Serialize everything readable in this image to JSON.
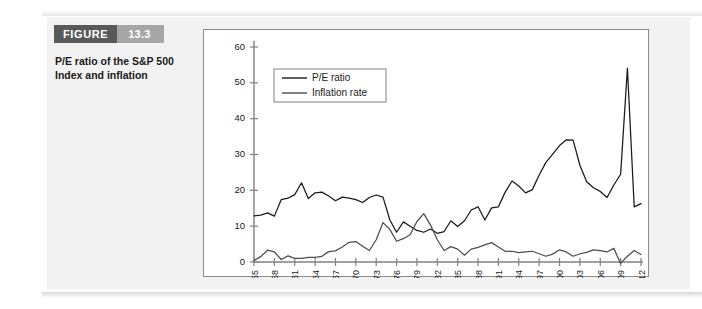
{
  "figure": {
    "tag_label": "FIGURE",
    "number": "13.3",
    "caption_line1": "P/E ratio of the S&P 500",
    "caption_line2": "Index and inflation"
  },
  "colors": {
    "tag_bg": "#595959",
    "number_bg": "#a6a6a6",
    "page_bg": "#f2f2f2",
    "chart_bg": "#ffffff",
    "chart_border": "#8c8c8c",
    "axis": "#808080",
    "pe_line": "#1a1a1a",
    "inflation_line": "#4d4d4d"
  },
  "chart_data": {
    "type": "line",
    "title": "",
    "xlabel": "",
    "ylabel": "",
    "xlim": [
      1955,
      2012
    ],
    "ylim": [
      0,
      60
    ],
    "yticks": [
      0,
      10,
      20,
      30,
      40,
      50,
      60
    ],
    "xticks": [
      1955,
      1958,
      1961,
      1964,
      1967,
      1970,
      1973,
      1976,
      1979,
      1982,
      1985,
      1988,
      1991,
      1994,
      1997,
      2000,
      2003,
      2006,
      2009,
      2012
    ],
    "xtick_labels": [
      "1955",
      "1958",
      "1961",
      "1964",
      "1967",
      "1970",
      "1973",
      "1976",
      "1979",
      "1982",
      "1985",
      "1988",
      "1991",
      "1994",
      "1997",
      "2000",
      "2003",
      "2006",
      "2009",
      "2012"
    ],
    "grid": false,
    "legend_position": "upper-left-inside",
    "x": [
      1955,
      1956,
      1957,
      1958,
      1959,
      1960,
      1961,
      1962,
      1963,
      1964,
      1965,
      1966,
      1967,
      1968,
      1969,
      1970,
      1971,
      1972,
      1973,
      1974,
      1975,
      1976,
      1977,
      1978,
      1979,
      1980,
      1981,
      1982,
      1983,
      1984,
      1985,
      1986,
      1987,
      1988,
      1989,
      1990,
      1991,
      1992,
      1993,
      1994,
      1995,
      1996,
      1997,
      1998,
      1999,
      2000,
      2001,
      2002,
      2003,
      2004,
      2005,
      2006,
      2007,
      2008,
      2009,
      2010,
      2011,
      2012
    ],
    "series": [
      {
        "name": "P/E ratio",
        "color": "#1a1a1a",
        "values": [
          12.9,
          13.1,
          13.7,
          12.8,
          17.4,
          17.8,
          18.8,
          22.1,
          17.7,
          19.3,
          19.5,
          18.4,
          17.1,
          18.1,
          17.8,
          17.4,
          16.6,
          18.0,
          18.7,
          18.1,
          11.8,
          8.3,
          11.2,
          10.0,
          8.8,
          8.3,
          9.2,
          8.0,
          8.5,
          11.5,
          9.9,
          11.5,
          14.5,
          15.4,
          11.7,
          15.1,
          15.4,
          19.5,
          22.6,
          21.2,
          19.3,
          20.2,
          24.3,
          27.8,
          30.1,
          32.5,
          34.1,
          34.0,
          27.0,
          22.4,
          20.7,
          19.7,
          18.0,
          21.5,
          24.5,
          54.1,
          15.4,
          16.3
        ]
      },
      {
        "name": "Inflation rate",
        "color": "#4d4d4d",
        "values": [
          0.4,
          1.5,
          3.3,
          2.8,
          0.7,
          1.7,
          1.0,
          1.0,
          1.3,
          1.3,
          1.6,
          2.9,
          3.1,
          4.2,
          5.5,
          5.7,
          4.4,
          3.2,
          6.2,
          11.0,
          9.1,
          5.8,
          6.5,
          7.6,
          11.3,
          13.5,
          10.3,
          6.2,
          3.2,
          4.3,
          3.6,
          1.9,
          3.6,
          4.1,
          4.8,
          5.4,
          4.2,
          3.0,
          3.0,
          2.6,
          2.8,
          3.0,
          2.3,
          1.6,
          2.2,
          3.4,
          2.8,
          1.6,
          2.3,
          2.7,
          3.4,
          3.2,
          2.8,
          3.8,
          -0.4,
          1.6,
          3.2,
          2.1
        ]
      }
    ]
  },
  "legend": {
    "items": [
      {
        "label": "P/E ratio",
        "color": "#1a1a1a"
      },
      {
        "label": "Inflation rate",
        "color": "#4d4d4d"
      }
    ]
  }
}
